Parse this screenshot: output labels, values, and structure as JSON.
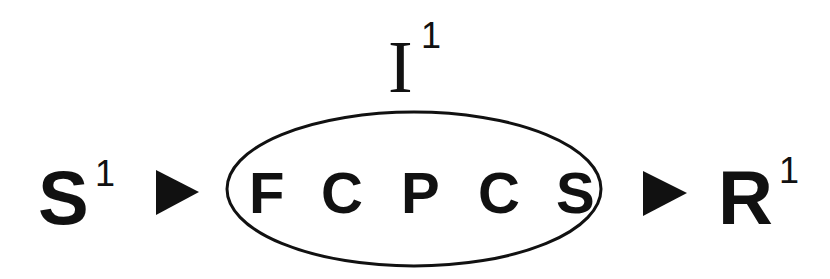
{
  "diagram": {
    "input": {
      "label": "I",
      "superscript": "1"
    },
    "stimulus": {
      "label": "S",
      "superscript": "1"
    },
    "response": {
      "label": "R",
      "superscript": "1"
    },
    "process_letters": [
      "F",
      "C",
      "P",
      "C",
      "S"
    ],
    "arrows": [
      "stimulus-to-process",
      "process-to-response"
    ],
    "colors": {
      "ink": "#111111",
      "background": "#ffffff"
    }
  }
}
